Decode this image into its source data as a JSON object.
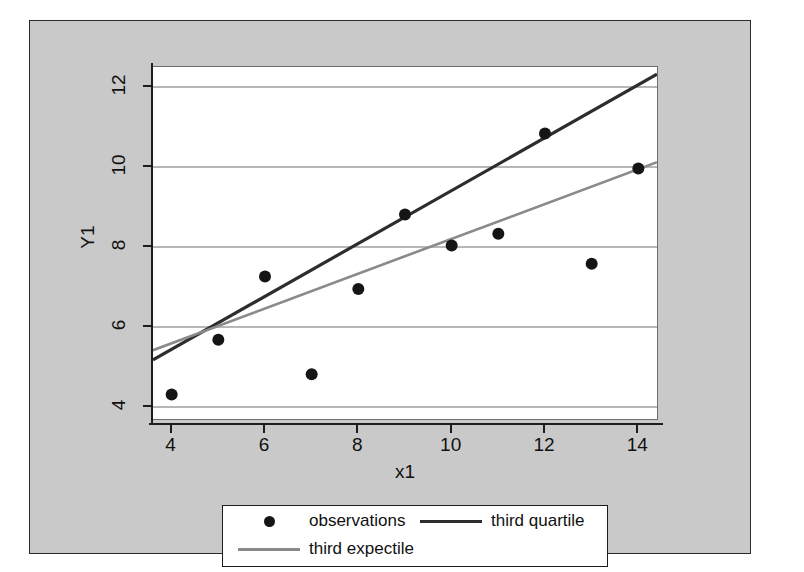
{
  "figure": {
    "background_color": "#ffffff",
    "canvas_color": "#c9c9c9",
    "plot_background_color": "#ffffff",
    "frame_color": "#2b2b2b"
  },
  "axes": {
    "x_title": "x1",
    "y_title": "Y1",
    "x_ticks": [
      "4",
      "6",
      "8",
      "10",
      "12",
      "14"
    ],
    "y_ticks": [
      "4",
      "6",
      "8",
      "10",
      "12"
    ]
  },
  "legend": {
    "entries": [
      {
        "label": "observations",
        "key": "marker-dot",
        "color": "#151515"
      },
      {
        "label": "third quartile",
        "key": "line",
        "color": "#2d2d2d"
      },
      {
        "label": "third expectile",
        "key": "line",
        "color": "#8a8a8a"
      }
    ]
  },
  "chart_data": {
    "type": "scatter",
    "title": "",
    "xlabel": "x1",
    "ylabel": "Y1",
    "xlim": [
      3.6,
      14.4
    ],
    "ylim": [
      3.7,
      12.5
    ],
    "xticks": [
      4,
      6,
      8,
      10,
      12,
      14
    ],
    "yticks": [
      4,
      6,
      8,
      10,
      12
    ],
    "grid": "horizontal",
    "legend_position": "below-axes",
    "series": [
      {
        "name": "observations",
        "type": "scatter",
        "color": "#151515",
        "marker": "filled-circle",
        "x": [
          4,
          5,
          6,
          7,
          8,
          9,
          10,
          11,
          12,
          13,
          14
        ],
        "y": [
          4.31,
          5.68,
          7.26,
          4.82,
          6.95,
          8.81,
          8.04,
          8.33,
          10.84,
          7.58,
          9.96
        ]
      },
      {
        "name": "third quartile",
        "type": "line",
        "color": "#2d2d2d",
        "x": [
          3.6,
          14.4
        ],
        "y": [
          5.18,
          12.32
        ]
      },
      {
        "name": "third expectile",
        "type": "line",
        "color": "#8a8a8a",
        "x": [
          3.6,
          14.4
        ],
        "y": [
          5.42,
          10.12
        ]
      }
    ]
  }
}
